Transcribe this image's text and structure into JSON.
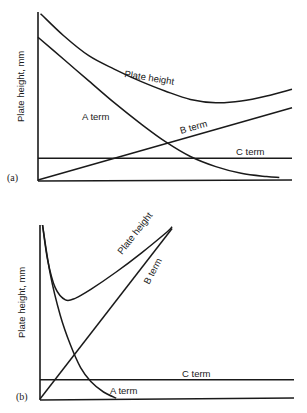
{
  "chart_data": [
    {
      "type": "line",
      "panel_label": "(a)",
      "title": "",
      "xlabel": "",
      "ylabel": "Plate height, mm",
      "xlim": [
        0,
        10
      ],
      "ylim": [
        0,
        10
      ],
      "grid": false,
      "legend": "none (inline curve labels)",
      "series": [
        {
          "name": "Plate height",
          "label": "Plate height",
          "x": [
            0.1,
            1,
            2,
            3,
            4,
            5,
            6,
            7,
            8,
            9,
            10
          ],
          "y": [
            9.9,
            8.6,
            7.4,
            6.6,
            5.9,
            5.3,
            4.8,
            4.6,
            4.7,
            5.0,
            5.4
          ]
        },
        {
          "name": "A term",
          "label": "A term",
          "x": [
            0,
            1,
            2,
            3,
            4,
            5,
            6,
            7,
            8,
            9,
            9.5
          ],
          "y": [
            8.5,
            7.2,
            5.9,
            4.6,
            3.4,
            2.3,
            1.4,
            0.8,
            0.4,
            0.2,
            0.15
          ]
        },
        {
          "name": "B term",
          "label": "B term",
          "x": [
            0,
            10
          ],
          "y": [
            0,
            4.3
          ]
        },
        {
          "name": "C term",
          "label": "C term",
          "x": [
            0,
            10
          ],
          "y": [
            1.3,
            1.3
          ]
        }
      ]
    },
    {
      "type": "line",
      "panel_label": "(b)",
      "title": "",
      "xlabel": "",
      "ylabel": "Plate height, mm",
      "xlim": [
        0,
        10
      ],
      "ylim": [
        0,
        10
      ],
      "grid": false,
      "legend": "none (inline curve labels)",
      "series": [
        {
          "name": "Plate height",
          "label": "Plate height",
          "x": [
            0.1,
            0.3,
            0.6,
            1,
            1.4,
            2,
            3,
            4,
            5,
            5.2
          ],
          "y": [
            10,
            8.0,
            6.4,
            5.7,
            5.8,
            6.3,
            7.3,
            8.4,
            9.6,
            9.9
          ]
        },
        {
          "name": "B term",
          "label": "B term",
          "x": [
            0,
            5.2
          ],
          "y": [
            0,
            9.8
          ]
        },
        {
          "name": "A term",
          "label": "A term",
          "x": [
            0.1,
            0.4,
            0.8,
            1.2,
            1.6,
            2.0,
            2.5,
            3.0
          ],
          "y": [
            10,
            7.2,
            4.8,
            3.1,
            1.8,
            1.0,
            0.4,
            0.05
          ]
        },
        {
          "name": "C term",
          "label": "C term",
          "x": [
            0,
            10
          ],
          "y": [
            1.1,
            1.1
          ]
        }
      ]
    }
  ]
}
